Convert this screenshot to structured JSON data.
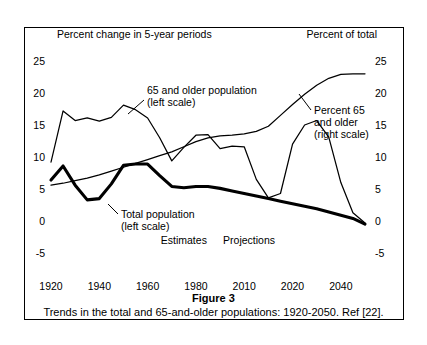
{
  "figure": {
    "title": "Figure 3",
    "caption": "Trends in the total and 65-and-older populations: 1920-2050. Ref [22]."
  },
  "chart_data": {
    "type": "line",
    "title": "",
    "subtitle": "",
    "left_axis_header": "Percent change in 5-year periods",
    "right_axis_header": "Percent of total",
    "xlabel": "",
    "ylabel": "",
    "grid": false,
    "legend_position": "inline-annotations",
    "xlim": [
      1920,
      2050
    ],
    "left_ylim": [
      -5,
      25
    ],
    "right_ylim": [
      -5,
      25
    ],
    "left_ticks": [
      "25",
      "20",
      "15",
      "10",
      "5",
      "0",
      "-5"
    ],
    "left_tick_values": [
      25,
      20,
      15,
      10,
      5,
      0,
      -5
    ],
    "right_ticks": [
      "25",
      "20",
      "15",
      "10",
      "5",
      "0",
      "-5"
    ],
    "right_tick_values": [
      25,
      20,
      15,
      10,
      5,
      0,
      -5
    ],
    "x_ticks": [
      "1920",
      "1940",
      "1960",
      "1980",
      "2010",
      "2020",
      "2040"
    ],
    "x_tick_values": [
      1920,
      1940,
      1960,
      1980,
      2000,
      2020,
      2040
    ],
    "annotations": [
      {
        "name": "estimates",
        "text": "Estimates",
        "x": 1975,
        "y": -3.0
      },
      {
        "name": "projections",
        "text": "Projections",
        "x": 2002,
        "y": -3.0
      }
    ],
    "series": [
      {
        "name": "65 and older population",
        "label_lines": [
          "65 and older population",
          "(left scale)"
        ],
        "axis": "left",
        "style": "thin",
        "x": [
          1920,
          1925,
          1930,
          1935,
          1940,
          1945,
          1950,
          1955,
          1960,
          1965,
          1970,
          1975,
          1980,
          1985,
          1990,
          1995,
          2000,
          2005,
          2010,
          2015,
          2020,
          2025,
          2030,
          2035,
          2040,
          2045,
          2050
        ],
        "values": [
          9.2,
          17.2,
          15.7,
          16.1,
          15.6,
          16.2,
          18.1,
          17.4,
          16.1,
          13.0,
          9.4,
          11.5,
          13.4,
          13.5,
          11.3,
          11.7,
          11.6,
          6.5,
          3.6,
          4.3,
          12.0,
          15.0,
          15.7,
          13.1,
          6.0,
          1.3,
          -0.3
        ]
      },
      {
        "name": "Total population",
        "label_lines": [
          "Total population",
          "(left scale)"
        ],
        "axis": "left",
        "style": "thick",
        "x": [
          1920,
          1925,
          1930,
          1935,
          1940,
          1945,
          1950,
          1955,
          1960,
          1965,
          1970,
          1975,
          1980,
          1985,
          1990,
          1995,
          2000,
          2005,
          2010,
          2015,
          2020,
          2025,
          2030,
          2035,
          2040,
          2045,
          2050
        ],
        "values": [
          6.4,
          8.6,
          5.6,
          3.3,
          3.5,
          5.8,
          8.7,
          8.9,
          8.9,
          7.1,
          5.4,
          5.2,
          5.4,
          5.4,
          5.1,
          4.7,
          4.3,
          3.9,
          3.5,
          3.1,
          2.7,
          2.3,
          1.9,
          1.4,
          0.9,
          0.4,
          -0.5
        ]
      },
      {
        "name": "Percent 65 and older",
        "label_lines": [
          "Percent 65",
          "and older",
          "(right scale)"
        ],
        "axis": "right",
        "style": "thin",
        "x": [
          1920,
          1925,
          1930,
          1935,
          1940,
          1945,
          1950,
          1955,
          1960,
          1965,
          1970,
          1975,
          1980,
          1985,
          1990,
          1995,
          2000,
          2005,
          2010,
          2015,
          2020,
          2025,
          2030,
          2035,
          2040,
          2045,
          2050
        ],
        "values": [
          5.6,
          5.9,
          6.3,
          6.7,
          7.2,
          7.8,
          8.4,
          9.0,
          9.6,
          10.2,
          10.8,
          11.6,
          12.4,
          13.0,
          13.3,
          13.4,
          13.6,
          14.0,
          14.8,
          16.5,
          18.2,
          19.8,
          21.2,
          22.3,
          22.9,
          23.0,
          23.0
        ]
      }
    ]
  }
}
